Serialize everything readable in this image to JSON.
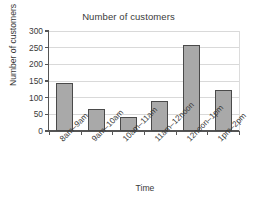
{
  "chart_data": {
    "type": "bar",
    "title": "Number of customers",
    "xlabel": "Time",
    "ylabel": "Number of customers",
    "categories": [
      "8am–9am",
      "9am–10am",
      "10am–11am",
      "11am–12noon",
      "12noon–1pm",
      "1pm–2pm"
    ],
    "values": [
      145,
      65,
      43,
      90,
      258,
      123
    ],
    "ylim": [
      0,
      300
    ],
    "yticks": [
      0,
      50,
      100,
      150,
      200,
      250,
      300
    ],
    "ytick_labels": [
      "0",
      "50",
      "100",
      "150",
      "200",
      "250",
      "300"
    ],
    "grid": "horizontal",
    "legend": "none",
    "bar_color": "#a9a9a9",
    "bar_border_color": "#4a4a4a",
    "axis_color": "#555555",
    "gridline_color": "#d9d9d9",
    "text_color": "#3a3a3a",
    "background_color": "#ffffff"
  }
}
